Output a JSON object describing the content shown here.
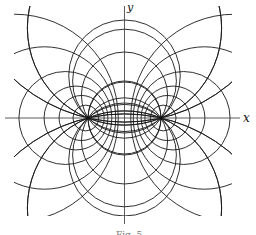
{
  "figure": {
    "type": "bipolar coordinate system",
    "axis_labels": {
      "x": "x",
      "y": "y"
    },
    "caption": "Fig. 5",
    "foci": [
      {
        "x": 88,
        "y": 118
      },
      {
        "x": 161,
        "y": 118
      }
    ],
    "center": {
      "x": 124.5,
      "y": 118
    },
    "half_focal_distance": 36.5,
    "circles_through_foci_offsets": [
      42.2,
      22.9,
      -0.5,
      -36.9,
      -160,
      160,
      90,
      -90
    ],
    "apollonian_offsets": [
      59.1,
      48.5,
      42.9,
      38.7,
      80,
      110
    ],
    "stroke_color": "#1a1a1a",
    "background": "#ffffff"
  }
}
